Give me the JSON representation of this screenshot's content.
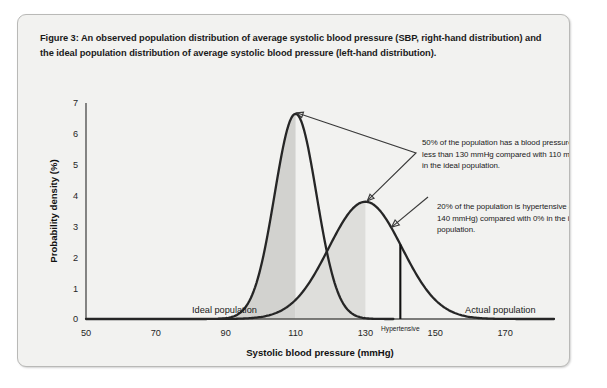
{
  "figure": {
    "caption": "Figure 3: An observed population distribution of average systolic blood pressure (SBP, right-hand distribution) and the ideal population distribution of average systolic blood pressure (left-hand distribution)."
  },
  "annotations": {
    "annotation_1": "50% of the population has a blood pressure of less than 130 mmHg compared with 110 mmHg in the ideal population.",
    "annotation_2": "20% of the population is hypertensive (SBP ≥ 140 mmHg) compared with 0% in the ideal population.",
    "hypertensive_marker_label": "Hypertensive"
  },
  "chart_data": {
    "type": "line",
    "title": "",
    "xlabel": "Systolic blood pressure (mmHg)",
    "ylabel": "Probability density (%)",
    "xlim": [
      50,
      184
    ],
    "ylim": [
      0,
      7
    ],
    "xticks": [
      50,
      70,
      90,
      110,
      130,
      150,
      170
    ],
    "xtick_labels": [
      "50",
      "70",
      "90",
      "110",
      "130",
      "150",
      "170"
    ],
    "yticks": [
      0,
      1,
      2,
      3,
      4,
      5,
      6,
      7
    ],
    "ytick_labels": [
      "0",
      "1",
      "2",
      "3",
      "4",
      "5",
      "6",
      "7"
    ],
    "grid": false,
    "legend": "inline-labels",
    "series": [
      {
        "name": "Ideal population",
        "label": "Ideal population",
        "distribution": "normal",
        "mean": 110,
        "sd": 6.0,
        "peak_density": 6.65,
        "shaded_region": [
          50,
          110
        ],
        "shade_color": "#d2d2cf",
        "stroke_color": "#262626"
      },
      {
        "name": "Actual population",
        "label": "Actual population",
        "distribution": "normal",
        "mean": 130,
        "sd": 10.5,
        "peak_density": 3.8,
        "shaded_region": [
          110,
          130
        ],
        "shade_color": "#dededb",
        "stroke_color": "#262626"
      }
    ],
    "markers": [
      {
        "name": "hypertensive-threshold",
        "x": 140,
        "label": "Hypertensive",
        "color": "#111111"
      }
    ],
    "annotations": [
      {
        "text": "50% of the population has a blood pressure of less than 130 mmHg compared with 110 mmHg in the ideal population.",
        "points_to": [
          [
            110,
            6.65
          ],
          [
            130,
            3.8
          ]
        ]
      },
      {
        "text": "20% of the population is hypertensive (SBP ≥ 140 mmHg) compared with 0% in the ideal population.",
        "points_to": [
          [
            140,
            3.1
          ]
        ]
      }
    ]
  }
}
